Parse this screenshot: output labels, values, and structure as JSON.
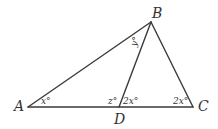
{
  "diagram": {
    "type": "geometry-triangle",
    "vertices": {
      "A": "A",
      "B": "B",
      "C": "C",
      "D": "D"
    },
    "segments": [
      "AB",
      "BC",
      "AC",
      "BD"
    ],
    "angles": {
      "A": "x°",
      "ABD": "y°",
      "ADB": "z°",
      "BDC": "2x°",
      "C": "2x°"
    },
    "stroke_color": "#3a3a3a",
    "text_color": "#333333"
  }
}
